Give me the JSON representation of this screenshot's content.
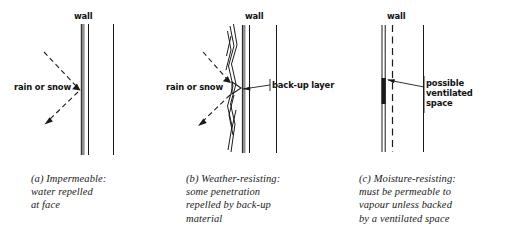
{
  "figure": {
    "background": "#ffffff",
    "ink": "#1a1a1a",
    "panels": [
      {
        "id": "a",
        "wall_label": "wall",
        "flow_label": "rain or snow",
        "caption_lines": [
          "(a) Impermeable:",
          "water repelled",
          "at face"
        ],
        "caption_text": "(a) Impermeable: water repelled at face",
        "annotation_label": null,
        "outer_face": "solid-impermeable",
        "incoming_arrow": "dashed-down-right",
        "reflected_arrow": "dashed-down-left"
      },
      {
        "id": "b",
        "wall_label": "wall",
        "flow_label": "rain or snow",
        "caption_lines": [
          "(b) Weather-resisting:",
          "some penetration",
          "repelled by back-up",
          "material"
        ],
        "caption_text": "(b) Weather-resisting: some penetration repelled by back-up material",
        "annotation_label": "back-up layer",
        "outer_face": "ragged-permeable",
        "incoming_arrow": "dashed-down-right",
        "reflected_arrow": "dashed-down-left"
      },
      {
        "id": "c",
        "wall_label": "wall",
        "flow_label": null,
        "caption_lines": [
          "(c) Moisture-resisting:",
          "must be permeable to",
          "vapour unless backed",
          "by a ventilated space"
        ],
        "caption_text": "(c) Moisture-resisting: must be permeable to vapour unless backed by a ventilated space",
        "annotation_label_lines": [
          "possible",
          "ventilated",
          "space"
        ],
        "annotation_label": "possible ventilated space",
        "outer_face": "solid-with-dashed-cavity",
        "incoming_arrow": null,
        "reflected_arrow": null
      }
    ]
  }
}
